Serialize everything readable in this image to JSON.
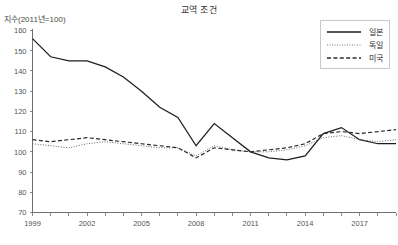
{
  "chart_data": {
    "type": "line",
    "title": "교역 조건",
    "ylabel": "지수(2011년=100)",
    "xlabel": "",
    "ylim": [
      70,
      160
    ],
    "xlim": [
      1999,
      2019
    ],
    "grid": false,
    "legend_position": "top-right",
    "yticks": [
      70,
      80,
      90,
      100,
      110,
      120,
      130,
      140,
      150,
      160
    ],
    "xticks": [
      1999,
      2002,
      2005,
      2008,
      2011,
      2014,
      2017
    ],
    "x": [
      1999,
      2000,
      2001,
      2002,
      2003,
      2004,
      2005,
      2006,
      2007,
      2008,
      2009,
      2010,
      2011,
      2012,
      2013,
      2014,
      2015,
      2016,
      2017,
      2018,
      2019
    ],
    "series": [
      {
        "name": "일본",
        "style": "solid",
        "color": "#1d1d1d",
        "values": [
          156,
          147,
          145,
          145,
          142,
          137,
          130,
          122,
          117,
          103,
          114,
          107,
          100,
          97,
          96,
          98,
          109,
          112,
          106,
          104,
          104
        ]
      },
      {
        "name": "독일",
        "style": "dotted",
        "color": "#666666",
        "values": [
          104,
          103,
          102,
          104,
          105,
          104,
          103,
          102,
          102,
          98,
          103,
          101,
          100,
          100,
          101,
          103,
          107,
          108,
          106,
          105,
          106
        ]
      },
      {
        "name": "미국",
        "style": "dashed",
        "color": "#2b2b2b",
        "values": [
          106,
          105,
          106,
          107,
          106,
          105,
          104,
          103,
          102,
          97,
          102,
          101,
          100,
          101,
          102,
          104,
          109,
          110,
          109,
          110,
          111
        ]
      }
    ]
  },
  "legend": {
    "items": [
      {
        "label": "일본",
        "style": "solid"
      },
      {
        "label": "독일",
        "style": "dotted"
      },
      {
        "label": "미국",
        "style": "dashed"
      }
    ]
  }
}
